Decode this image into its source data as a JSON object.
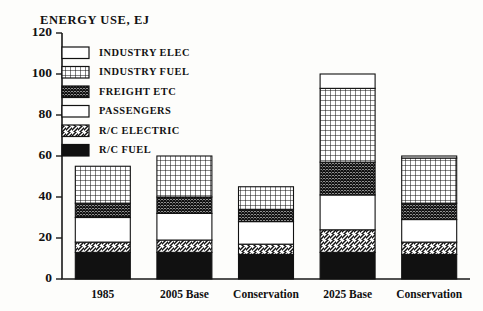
{
  "chart_data": {
    "type": "bar",
    "title": "ENERGY USE, EJ",
    "xlabel": "",
    "ylabel": "ENERGY USE, EJ",
    "ylim": [
      0,
      120
    ],
    "yticks": [
      0,
      20,
      40,
      60,
      80,
      100,
      120
    ],
    "grid": false,
    "stacked": true,
    "legend_position": "upper-left-inside",
    "categories": [
      "1985",
      "2005 Base",
      "Conservation",
      "2025 Base",
      "Conservation"
    ],
    "series": [
      {
        "name": "R/C FUEL",
        "pattern": "solid-black",
        "values": [
          13,
          13,
          12,
          13,
          12
        ]
      },
      {
        "name": "R/C ELECTRIC",
        "pattern": "diagonal-hatch",
        "values": [
          5,
          6,
          5,
          11,
          6
        ]
      },
      {
        "name": "PASSENGERS",
        "pattern": "white",
        "values": [
          12,
          13,
          11,
          17,
          11
        ]
      },
      {
        "name": "FREIGHT ETC",
        "pattern": "dense-crosshatch",
        "values": [
          7,
          8,
          6,
          16,
          8
        ]
      },
      {
        "name": "INDUSTRY FUEL",
        "pattern": "dotted-grid",
        "values": [
          18,
          20,
          11,
          36,
          22
        ]
      },
      {
        "name": "INDUSTRY ELEC",
        "pattern": "white",
        "values": [
          0,
          0,
          0,
          7,
          1
        ]
      }
    ],
    "totals": [
      55,
      60,
      45,
      100,
      60
    ]
  },
  "legend": {
    "items": [
      {
        "label": "INDUSTRY ELEC",
        "pattern": "white"
      },
      {
        "label": "INDUSTRY FUEL",
        "pattern": "dotted-grid"
      },
      {
        "label": "FREIGHT ETC",
        "pattern": "dense-crosshatch"
      },
      {
        "label": "PASSENGERS",
        "pattern": "white"
      },
      {
        "label": "R/C ELECTRIC",
        "pattern": "diagonal-hatch"
      },
      {
        "label": "R/C FUEL",
        "pattern": "solid-black"
      }
    ]
  },
  "colors": {
    "ink": "#111111",
    "paper": "#fdfdfb"
  }
}
